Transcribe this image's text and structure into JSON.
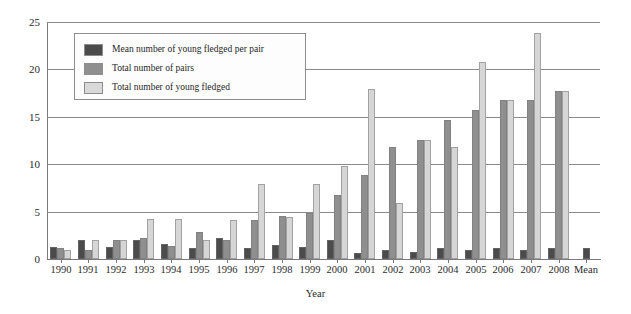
{
  "chart_data": {
    "type": "bar",
    "title": "",
    "xlabel": "Year",
    "ylabel": "",
    "ylim": [
      0,
      25
    ],
    "yticks": [
      0,
      5,
      10,
      15,
      20,
      25
    ],
    "grid": true,
    "legend_position": "upper-left-inside",
    "categories": [
      "1990",
      "1991",
      "1992",
      "1993",
      "1994",
      "1995",
      "1996",
      "1997",
      "1998",
      "1999",
      "2000",
      "2001",
      "2002",
      "2003",
      "2004",
      "2005",
      "2006",
      "2007",
      "2008",
      "Mean"
    ],
    "series": [
      {
        "name": "Mean number of young fledged per pair",
        "color": "#4b4b4b",
        "values": [
          1.3,
          2.0,
          1.3,
          2.0,
          1.6,
          1.2,
          2.2,
          1.2,
          1.5,
          1.3,
          2.0,
          0.6,
          0.9,
          0.7,
          1.2,
          0.9,
          1.2,
          0.9,
          1.2,
          1.2
        ]
      },
      {
        "name": "Total number of pairs",
        "color": "#8f8f8f",
        "values": [
          1.2,
          1.0,
          2.0,
          2.2,
          1.4,
          2.9,
          2.0,
          4.1,
          4.5,
          4.9,
          6.8,
          8.9,
          11.8,
          12.6,
          14.7,
          15.7,
          16.8,
          16.8,
          17.7,
          null
        ]
      },
      {
        "name": "Total number of young fledged",
        "color": "#d9d9d9",
        "values": [
          1.0,
          2.0,
          2.0,
          4.2,
          4.2,
          2.0,
          4.1,
          7.9,
          4.4,
          7.9,
          9.8,
          17.9,
          5.9,
          12.6,
          11.8,
          20.8,
          16.8,
          23.8,
          17.7,
          null
        ]
      }
    ]
  },
  "legend": {
    "items": [
      {
        "label": "Mean number of young fledged per pair",
        "swatch": "s0"
      },
      {
        "label": "Total number of pairs",
        "swatch": "s1"
      },
      {
        "label": "Total number of young fledged",
        "swatch": "s2"
      }
    ]
  }
}
